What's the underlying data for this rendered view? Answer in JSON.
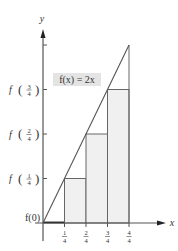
{
  "diagram": {
    "type": "riemann-sum-left",
    "function_label": "f(x) = 2x",
    "function": {
      "name": "f",
      "expression": "2x",
      "slope": 2
    },
    "axes": {
      "x_label": "x",
      "y_label": "y",
      "x_ticks": [
        {
          "value": 0.25,
          "num": "1",
          "den": "4"
        },
        {
          "value": 0.5,
          "num": "2",
          "den": "4"
        },
        {
          "value": 0.75,
          "num": "3",
          "den": "4"
        },
        {
          "value": 1.0,
          "num": "4",
          "den": "4"
        }
      ],
      "y_ticks": [
        {
          "value": 0,
          "label_type": "plain",
          "text": "f(0)"
        },
        {
          "value": 0.5,
          "label_type": "frac",
          "fname": "f",
          "num": "1",
          "den": "4"
        },
        {
          "value": 1.0,
          "label_type": "frac",
          "fname": "f",
          "num": "2",
          "den": "4"
        },
        {
          "value": 1.5,
          "label_type": "frac",
          "fname": "f",
          "num": "3",
          "den": "4"
        },
        {
          "value": 2.0,
          "label_type": "none"
        }
      ]
    },
    "rectangles": [
      {
        "x0": 0,
        "x1": 0.25,
        "height": 0
      },
      {
        "x0": 0.25,
        "x1": 0.5,
        "height": 0.5
      },
      {
        "x0": 0.5,
        "x1": 0.75,
        "height": 1.0
      },
      {
        "x0": 0.75,
        "x1": 1.0,
        "height": 1.5
      }
    ],
    "domain": [
      0,
      1
    ],
    "range": [
      0,
      2
    ],
    "colors": {
      "axis": "#555555",
      "rect_fill": "#f0f0f0",
      "rect_stroke": "#666666",
      "line": "#555555",
      "label_box": "#e4e4e4",
      "zero_rect": "#111111"
    }
  }
}
